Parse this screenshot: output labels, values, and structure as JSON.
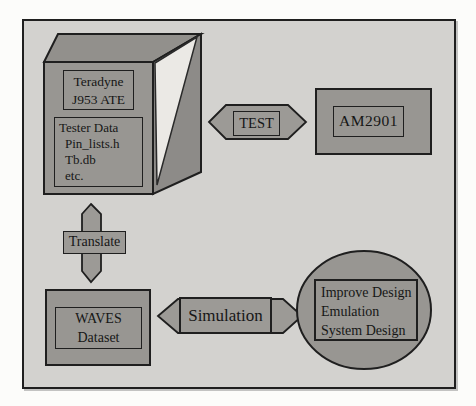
{
  "figure": {
    "type": "flow-diagram",
    "nodes": {
      "ate_cube": {
        "title_lines": [
          "Teradyne",
          "J953 ATE"
        ],
        "file_lines": [
          "Tester Data",
          "Pin_lists.h",
          "Tb.db",
          "etc."
        ]
      },
      "device_box": {
        "label": "AM2901"
      },
      "waves_box": {
        "lines": [
          "WAVES",
          "Dataset"
        ]
      },
      "design_ellipse": {
        "lines": [
          "Improve Design",
          "Emulation",
          "System Design"
        ]
      }
    },
    "connectors": {
      "test": {
        "label": "TEST",
        "style": "double-headed-horizontal-arrow"
      },
      "translate": {
        "label": "Translate",
        "style": "double-headed-vertical-arrow"
      },
      "simulation": {
        "label": "Simulation",
        "style": "double-headed-horizontal-arrow"
      }
    },
    "colors": {
      "canvas_bg": "#d3d2cf",
      "shape_fill": "#989692",
      "arrow_fill": "#9c9a96",
      "cube_top_fill": "#92908c",
      "cube_side_fill": "#8d8b88",
      "highlight_wedge_fill": "#ebe9e5",
      "border": "#1f1f1f"
    }
  }
}
